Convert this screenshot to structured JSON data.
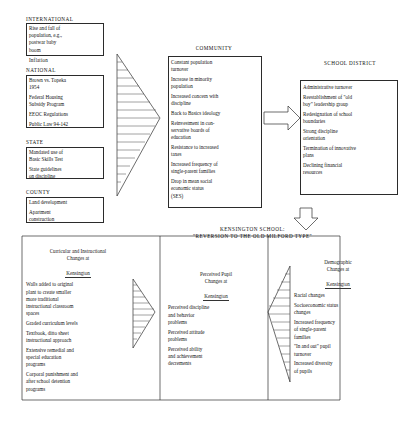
{
  "figure": {
    "headers": {
      "international": "INTERNATIONAL",
      "national": "NATIONAL",
      "state": "STATE",
      "county": "COUNTY",
      "community": "COMMUNITY",
      "school_district": "SCHOOL DISTRICT",
      "kensington": "KENSINGTON SCHOOL:\n\"REVERSION TO THE OLD MILFORD TYPE\""
    },
    "international_items": [
      "Rise and fall of\npopulation, e.g.,\npostwar baby\nboom",
      "Inflation"
    ],
    "national_items": [
      "Brown vs. Topeka\n1954",
      "Federal Housing\nSubsidy Program",
      "EEOC Regulations",
      "Public Law 94-142"
    ],
    "state_items": [
      "Mandated use of\nBasic Skills Test",
      "State guidelines\non discipline"
    ],
    "county_items": [
      "Land development",
      "Apartment\nconstruction"
    ],
    "community_items": [
      "Constant population\nturnover",
      "Increase in minority\npopulation",
      "Increased concern with\ndiscipline",
      "Back to Basics ideology",
      "Reinvestment in con-\nservative boards of\neducation",
      "Resistance to increased\ntaxes",
      "Increased frequency of\nsingle-parent families",
      "Drop in mean social\neconomic status\n(SES)"
    ],
    "school_district_items": [
      "Administrative turnover",
      "Reestablishment of \"old\nboy\" leadership group",
      "Redesignation of school\nboundaries",
      "Strong discipline\norientation",
      "Termination of innovative\nplans",
      "Declining financial\nresources"
    ],
    "curricular": {
      "title": "Curricular and Instructional\nChanges at",
      "title_underlined": "Kensington",
      "items": [
        "Walls added to original\nplant to create smaller\nmore traditional\ninstructional classroom\nspaces",
        "Graded curriculum levels",
        "Textbook, ditto sheet\ninstructional approach",
        "Extensive remedial and\nspecial education\nprograms",
        "Corporal punishment and\nafter school detention\nprograms"
      ]
    },
    "pupil": {
      "title": "Perceived Pupil\nChanges at",
      "title_underlined": "Kensington",
      "items": [
        "Perceived discipline\nand behavior\nproblems",
        "Perceived attitude\nproblems",
        "Perceived ability\nand achievement\ndecrements"
      ]
    },
    "demographic": {
      "title": "Demographic\nChanges at",
      "title_underlined": "Kensington",
      "items": [
        "Racial changes",
        "Socioeconomic status\nchanges",
        "Increased frequency\nof single-parent\nfamilies",
        "\"In and out\" pupil\nturnover",
        "Increased diversity\nof pupils"
      ]
    }
  }
}
